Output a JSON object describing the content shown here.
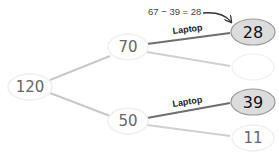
{
  "diagram": {
    "type": "tree",
    "colors": {
      "edge_faint": "#c8c8c8",
      "edge_highlight": "#6e6e6e",
      "node_outline_faint": "#efefef",
      "node_fill_highlight": "#dcdcdc",
      "node_border_highlight": "#9a9a9a",
      "text_muted": "#666666",
      "text_dark": "#111111"
    },
    "nodes": {
      "root": {
        "value": "120"
      },
      "upper": {
        "value": "70"
      },
      "lower": {
        "value": "50"
      },
      "upper_laptop": {
        "value": "28",
        "highlighted": true
      },
      "upper_other": {
        "value": ""
      },
      "lower_laptop": {
        "value": "39",
        "highlighted": true
      },
      "lower_other": {
        "value": "11"
      }
    },
    "edges": {
      "upper_laptop_label": "Laptop",
      "lower_laptop_label": "Laptop"
    },
    "annotation": {
      "text": "67 − 39 = 28",
      "target": "upper_laptop"
    }
  }
}
